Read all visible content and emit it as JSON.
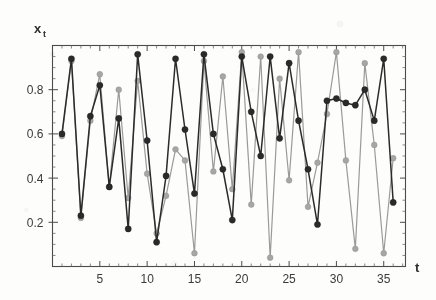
{
  "chart_data": {
    "type": "line",
    "title": "",
    "subtitle": "",
    "xlabel": "t",
    "ylabel": "x",
    "ylabel_subscript": "t",
    "xlim": [
      0,
      37.3
    ],
    "ylim": [
      0,
      1.0
    ],
    "grid": false,
    "legend": null,
    "x_tick_labels": [
      "5",
      "10",
      "15",
      "20",
      "25",
      "30",
      "35"
    ],
    "x_ticks": [
      5,
      10,
      15,
      20,
      25,
      30,
      35
    ],
    "y_tick_labels": [
      "0.2",
      "0.4",
      "0.6",
      "0.8"
    ],
    "y_ticks": [
      0.2,
      0.4,
      0.6,
      0.8
    ],
    "x": [
      1,
      2,
      3,
      4,
      5,
      6,
      7,
      8,
      9,
      10,
      11,
      12,
      13,
      14,
      15,
      16,
      17,
      18,
      19,
      20,
      21,
      22,
      23,
      24,
      25,
      26,
      27,
      28,
      29,
      30,
      31,
      32,
      33,
      34,
      35,
      36
    ],
    "series": [
      {
        "name": "dark-series",
        "color": "#2a2a2a",
        "marker": "filled-circle",
        "values": [
          0.6,
          0.94,
          0.23,
          0.68,
          0.82,
          0.36,
          0.67,
          0.17,
          0.96,
          0.57,
          0.11,
          0.41,
          0.94,
          0.62,
          0.33,
          0.96,
          0.6,
          0.44,
          0.21,
          0.95,
          0.7,
          0.5,
          0.95,
          0.58,
          0.92,
          0.66,
          0.44,
          0.19,
          0.75,
          0.76,
          0.74,
          0.73,
          0.8,
          0.66,
          0.94,
          0.29
        ]
      },
      {
        "name": "light-series",
        "color": "#a6a6a6",
        "marker": "filled-circle",
        "values": [
          0.59,
          0.93,
          0.22,
          0.66,
          0.87,
          0.36,
          0.8,
          0.31,
          0.84,
          0.42,
          0.15,
          0.32,
          0.53,
          0.48,
          0.06,
          0.93,
          0.43,
          0.86,
          0.35,
          0.97,
          0.28,
          0.95,
          0.04,
          0.85,
          0.39,
          0.97,
          0.27,
          0.47,
          0.69,
          0.97,
          0.48,
          0.08,
          0.92,
          0.55,
          0.06,
          0.49
        ]
      }
    ]
  },
  "axis": {
    "ylabel_main": "x",
    "ylabel_sub": "t",
    "xlabel_main": "t"
  }
}
